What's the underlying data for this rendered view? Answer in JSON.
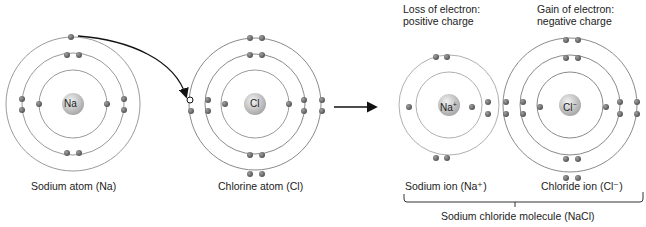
{
  "atoms": {
    "sodium_atom": {
      "symbol": "Na",
      "caption": "Sodium atom (Na)"
    },
    "chlorine_atom": {
      "symbol": "Cl",
      "caption": "Chlorine atom (Cl)"
    },
    "sodium_ion": {
      "symbol": "Na",
      "charge": "+",
      "caption": "Sodium ion (Na⁺)"
    },
    "chloride_ion": {
      "symbol": "Cl",
      "charge": "−",
      "caption": "Chloride ion (Cl⁻)"
    }
  },
  "notes": {
    "loss_line1": "Loss of electron:",
    "loss_line2": "positive charge",
    "gain_line1": "Gain of electron:",
    "gain_line2": "negative charge"
  },
  "bracket_label": "Sodium chloride molecule (NaCl)",
  "colors": {
    "orbit": "#9a9a9a",
    "electron": "#6e6e6e",
    "nucleus": "#c8c8c8",
    "arrow": "#111111"
  }
}
